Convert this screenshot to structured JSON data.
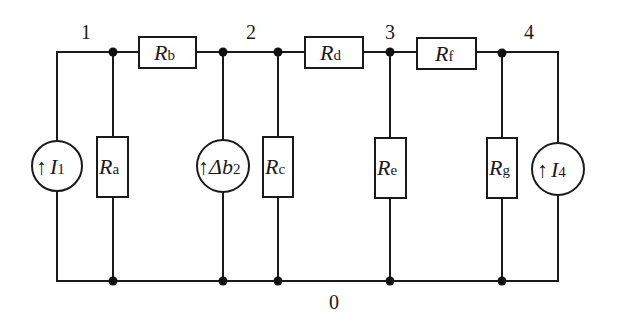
{
  "diagram": {
    "type": "circuit",
    "nodes": [
      {
        "id": "1",
        "label": "1"
      },
      {
        "id": "2",
        "label": "2"
      },
      {
        "id": "3",
        "label": "3"
      },
      {
        "id": "4",
        "label": "4"
      },
      {
        "id": "0",
        "label": "0"
      }
    ],
    "resistors": {
      "Ra": {
        "main": "R",
        "sub": "a",
        "between": [
          "1",
          "0"
        ]
      },
      "Rb": {
        "main": "R",
        "sub": "b",
        "between": [
          "1",
          "2"
        ]
      },
      "Rc": {
        "main": "R",
        "sub": "c",
        "between": [
          "2",
          "0"
        ]
      },
      "Rd": {
        "main": "R",
        "sub": "d",
        "between": [
          "2",
          "3"
        ]
      },
      "Re": {
        "main": "R",
        "sub": "e",
        "between": [
          "3",
          "0"
        ]
      },
      "Rf": {
        "main": "R",
        "sub": "f",
        "between": [
          "3",
          "4"
        ]
      },
      "Rg": {
        "main": "R",
        "sub": "g",
        "between": [
          "4",
          "0"
        ]
      }
    },
    "sources": {
      "I1": {
        "arrow": "↑",
        "main": "I",
        "sub": "1",
        "between": [
          "0",
          "1"
        ]
      },
      "db2": {
        "arrow": "↑",
        "main": "Δb",
        "sub": "2",
        "between": [
          "0",
          "2"
        ]
      },
      "I4": {
        "arrow": "↑",
        "main": "I",
        "sub": "4",
        "between": [
          "0",
          "4"
        ]
      }
    }
  }
}
